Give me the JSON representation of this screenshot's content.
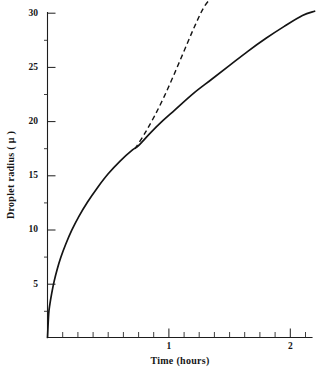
{
  "chart_data": {
    "type": "line",
    "title": "",
    "xlabel": "Time (hours)",
    "ylabel": "Droplet radius ( μ )",
    "xlim": [
      0,
      2.24
    ],
    "ylim": [
      0,
      31.2
    ],
    "grid": false,
    "legend": "none",
    "x_ticks_labeled": [
      {
        "value": 1,
        "label": "1"
      },
      {
        "value": 2,
        "label": "2"
      }
    ],
    "x_ticks_minor": [
      0.125,
      0.25,
      0.375,
      0.5,
      0.625,
      0.75,
      0.875,
      1.125,
      1.25,
      1.375,
      1.5,
      1.625,
      1.75,
      1.875,
      2.125
    ],
    "y_ticks_labeled": [
      {
        "value": 5,
        "label": "5"
      },
      {
        "value": 10,
        "label": "10"
      },
      {
        "value": 15,
        "label": "15"
      },
      {
        "value": 20,
        "label": "20"
      },
      {
        "value": 25,
        "label": "25"
      },
      {
        "value": 30,
        "label": "30"
      }
    ],
    "series": [
      {
        "name": "droplet-growth-solid",
        "style": "solid",
        "color": "#141414",
        "x": [
          0,
          0.01,
          0.02,
          0.035,
          0.055,
          0.08,
          0.11,
          0.15,
          0.2,
          0.26,
          0.33,
          0.41,
          0.5,
          0.6,
          0.7,
          0.75,
          0.85,
          0.95,
          1.05,
          1.2,
          1.35,
          1.5,
          1.65,
          1.8,
          1.95,
          2.1,
          2.2
        ],
        "y": [
          0,
          2.2,
          3.1,
          4.1,
          5.2,
          6.3,
          7.4,
          8.6,
          9.9,
          11.2,
          12.5,
          13.8,
          15.1,
          16.3,
          17.3,
          17.7,
          18.9,
          20.0,
          21.0,
          22.5,
          23.8,
          25.1,
          26.4,
          27.6,
          28.7,
          29.7,
          30.1
        ]
      },
      {
        "name": "droplet-growth-dashed",
        "style": "dashed",
        "color": "#141414",
        "x": [
          0.72,
          0.8,
          0.88,
          0.96,
          1.04,
          1.12,
          1.2,
          1.28,
          1.34,
          1.38
        ],
        "y": [
          17.4,
          18.8,
          20.4,
          22.2,
          24.2,
          26.3,
          28.4,
          30.3,
          31.2,
          31.4
        ]
      }
    ],
    "annotations": [
      {
        "text": "curves coincide below t ≈ 0.75 h, r ≈ 17.5 μ"
      }
    ]
  },
  "axes": {
    "x_axis_title": "Time (hours)",
    "y_axis_title": "Droplet radius ( μ )"
  },
  "labels": {
    "y30": "30",
    "y25": "25",
    "y20": "20",
    "y15": "15",
    "y10": "10",
    "y5": "5",
    "x1": "1",
    "x2": "2"
  },
  "colors": {
    "ink": "#141414",
    "background": "#ffffff"
  }
}
